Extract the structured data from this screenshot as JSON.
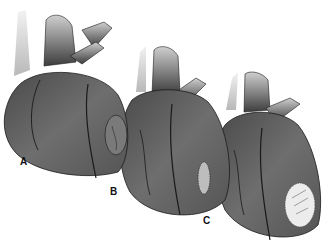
{
  "figure": {
    "labels": {
      "a": "A",
      "b": "B",
      "c": "C"
    },
    "colors": {
      "background": "#ffffff",
      "heart_dark": "#3a3a3a",
      "heart_mid": "#6a6a6a",
      "vessel_light": "#d8d8d8",
      "patch": "#e8e8e8",
      "outline": "#1a1a1a"
    }
  }
}
